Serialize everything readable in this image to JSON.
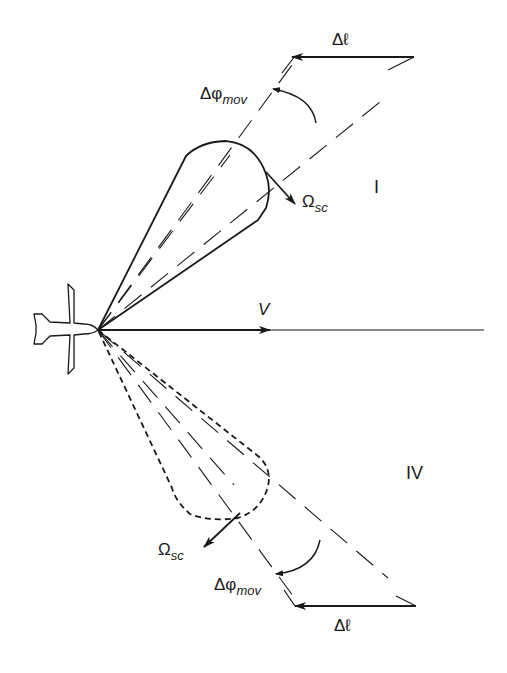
{
  "diagram": {
    "type": "aircraft side-looking sensor beam geometry",
    "labels": {
      "velocity": "V",
      "quadrant_upper": "I",
      "quadrant_lower": "IV",
      "omega_upper": {
        "symbol": "Ω",
        "subscript": "sc"
      },
      "omega_lower": {
        "symbol": "Ω",
        "subscript": "sc"
      },
      "dphi_upper": {
        "symbol": "Δφ",
        "subscript": "mov"
      },
      "dphi_lower": {
        "symbol": "Δφ",
        "subscript": "mov"
      },
      "dl_upper": "Δℓ",
      "dl_lower": "Δℓ"
    },
    "elements": [
      "aircraft-icon",
      "velocity-vector",
      "upper-beam-lobe (solid)",
      "lower-beam-lobe (dashed)",
      "scan-direction-arrows",
      "beam-center dashed lines",
      "displacement arrows Δℓ",
      "angular displacement arcs Δφmov"
    ],
    "colors": {
      "stroke": "#1a1a1a",
      "background": "#ffffff"
    }
  }
}
